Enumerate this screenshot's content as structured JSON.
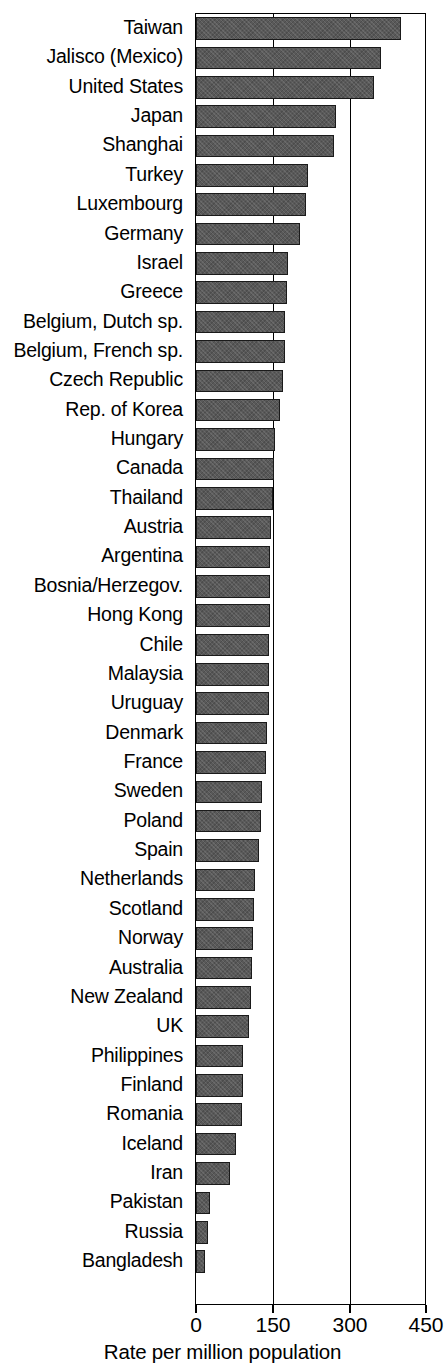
{
  "chart_data": {
    "type": "bar",
    "orientation": "horizontal",
    "title": "",
    "subtitle": "",
    "xlabel": "Rate per million population",
    "ylabel": "",
    "xlim": [
      0,
      450
    ],
    "xticks": [
      0,
      150,
      300,
      450
    ],
    "xtick_labels": [
      "0",
      "150",
      "300",
      "450"
    ],
    "grid": "vertical gridlines at 150 and 300",
    "legend": "none",
    "bar_color": "#595959",
    "bar_edge_color": "#1a1a1a",
    "background_color": "#ffffff",
    "categories": [
      "Taiwan",
      "Jalisco (Mexico)",
      "United States",
      "Japan",
      "Shanghai",
      "Turkey",
      "Luxembourg",
      "Germany",
      "Israel",
      "Greece",
      "Belgium, Dutch sp.",
      "Belgium, French sp.",
      "Czech Republic",
      "Rep. of Korea",
      "Hungary",
      "Canada",
      "Thailand",
      "Austria",
      "Argentina",
      "Bosnia/Herzegov.",
      "Hong Kong",
      "Chile",
      "Malaysia",
      "Uruguay",
      "Denmark",
      "France",
      "Sweden",
      "Poland",
      "Spain",
      "Netherlands",
      "Scotland",
      "Norway",
      "Australia",
      "New Zealand",
      "UK",
      "Philippines",
      "Finland",
      "Romania",
      "Iceland",
      "Iran",
      "Pakistan",
      "Russia",
      "Bangladesh"
    ],
    "values": [
      405,
      365,
      352,
      277,
      272,
      222,
      218,
      205,
      182,
      180,
      176,
      175,
      172,
      165,
      155,
      154,
      152,
      148,
      147,
      146,
      146,
      145,
      145,
      144,
      140,
      138,
      130,
      129,
      124,
      116,
      115,
      113,
      110,
      108,
      104,
      93,
      92,
      91,
      78,
      68,
      27,
      24,
      18
    ]
  },
  "axis": {
    "x_tick_labels": [
      "0",
      "150",
      "300",
      "450"
    ],
    "x_axis_title": "Rate per million population"
  }
}
